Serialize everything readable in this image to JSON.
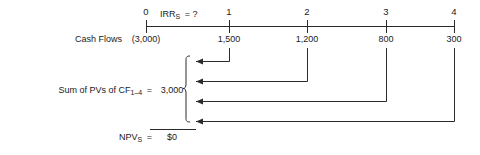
{
  "diagram": {
    "axis": {
      "start_period": 0,
      "end_period": 4,
      "tick_count": 5
    },
    "irr_label": {
      "text": "IRR",
      "subscript": "S",
      "equals": "= ?",
      "full": "IRRS = ?"
    },
    "periods": [
      {
        "label": "0",
        "x": 146
      },
      {
        "label": "1",
        "x": 229
      },
      {
        "label": "2",
        "x": 307
      },
      {
        "label": "3",
        "x": 386
      },
      {
        "label": "4",
        "x": 454
      }
    ],
    "cash_flow_row": {
      "label": "Cash Flows",
      "values": [
        {
          "text": "(3,000)",
          "period": 0,
          "amount": -3000
        },
        {
          "text": "1,500",
          "period": 1,
          "amount": 1500
        },
        {
          "text": "1,200",
          "period": 2,
          "amount": 1200
        },
        {
          "text": "800",
          "period": 3,
          "amount": 800
        },
        {
          "text": "300",
          "period": 4,
          "amount": 300
        }
      ]
    },
    "sum_row": {
      "label_prefix": "Sum of PVs of CF",
      "label_subscript": "1–4",
      "label_equals": "=",
      "label_full": "Sum of PVs of CF1–4 =",
      "value": "3,000"
    },
    "npv_row": {
      "label_prefix": "NPV",
      "label_subscript": "S",
      "label_equals": "=",
      "label_full": "NPVS =",
      "value": "$0"
    },
    "discount_arrows": [
      {
        "from_period": 1,
        "from_x": 229,
        "y": 61,
        "to_x": 193
      },
      {
        "from_period": 2,
        "from_x": 307,
        "y": 81,
        "to_x": 193
      },
      {
        "from_period": 3,
        "from_x": 386,
        "y": 102,
        "to_x": 193
      },
      {
        "from_period": 4,
        "from_x": 454,
        "y": 121,
        "to_x": 193
      }
    ],
    "colors": {
      "ink": "#2b2b2b",
      "background": "#ffffff"
    }
  }
}
